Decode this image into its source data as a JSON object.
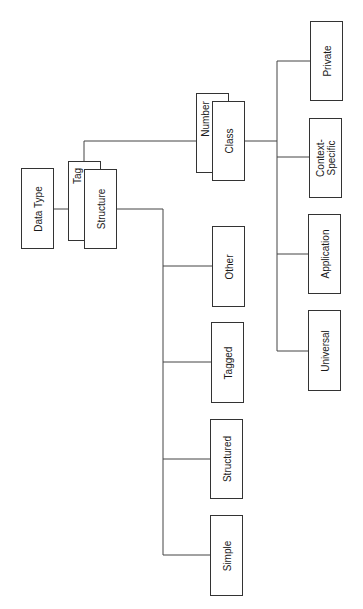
{
  "diagram": {
    "type": "tree",
    "orientation": "rotated-90-ccw",
    "root": {
      "label": "Data Type"
    },
    "tag": {
      "label": "Tag"
    },
    "structure": {
      "label": "Structure"
    },
    "number": {
      "label": "Number"
    },
    "class": {
      "label": "Class"
    },
    "class_children": [
      {
        "label": "Private"
      },
      {
        "label": "Context-\nSpecific"
      },
      {
        "label": "Application"
      },
      {
        "label": "Universal"
      }
    ],
    "structure_children": [
      {
        "label": "Other"
      },
      {
        "label": "Tagged"
      },
      {
        "label": "Structured"
      },
      {
        "label": "Simple"
      }
    ],
    "colors": {
      "line": "#444444",
      "border": "#333333",
      "text": "#1a1a1a",
      "background": "#ffffff"
    }
  }
}
